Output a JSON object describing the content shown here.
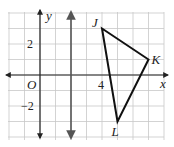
{
  "diagram": {
    "type": "coordinate-grid",
    "grid": {
      "x_min": -2,
      "x_max": 8,
      "y_min": -4,
      "y_max": 4,
      "origin_px": [
        40,
        75
      ],
      "unit_px": 15.5,
      "line_color": "#c8c8c8"
    },
    "axes": {
      "x_label": "x",
      "y_label": "y",
      "origin_label": "O",
      "color": "#222222"
    },
    "tick_labels": [
      {
        "axis": "y",
        "value": 2,
        "text": "2"
      },
      {
        "axis": "y",
        "value": -2,
        "text": "−2"
      },
      {
        "axis": "x",
        "value": 4,
        "text": "4"
      }
    ],
    "reflection_line": {
      "equation": "x = 2",
      "x": 2,
      "color": "#555555"
    },
    "triangle": {
      "name": "JKL",
      "color": "#111111",
      "vertices": [
        {
          "label": "J",
          "x": 4,
          "y": 3
        },
        {
          "label": "K",
          "x": 7,
          "y": 1
        },
        {
          "label": "L",
          "x": 5,
          "y": -3
        }
      ]
    }
  }
}
